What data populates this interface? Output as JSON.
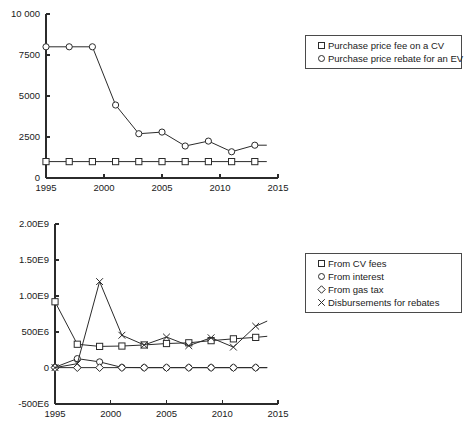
{
  "chart_data": [
    {
      "id": "top",
      "type": "line",
      "title": "",
      "xlabel": "",
      "ylabel": "",
      "xlim": [
        1995,
        2015
      ],
      "ylim": [
        0,
        10000
      ],
      "grid": false,
      "legend_position": "right",
      "x_ticks": [
        "1995",
        "2000",
        "2005",
        "2010",
        "2015"
      ],
      "x_tick_values": [
        1995,
        2000,
        2005,
        2010,
        2015
      ],
      "y_ticks": [
        "0",
        "2500",
        "5000",
        "7500",
        "10 000"
      ],
      "y_tick_values": [
        0,
        2500,
        5000,
        7500,
        10000
      ],
      "x": [
        1995,
        1997,
        1999,
        2001,
        2003,
        2005,
        2007,
        2009,
        2011,
        2013
      ],
      "series": [
        {
          "name": "Purchase price fee on a CV",
          "marker": "square",
          "values": [
            1000,
            1000,
            1000,
            1000,
            1000,
            1000,
            1000,
            1000,
            1000,
            1000
          ],
          "tail_x": 2014,
          "tail_y": 1000
        },
        {
          "name": "Purchase price rebate for an EV",
          "marker": "circle",
          "values": [
            8000,
            8000,
            8000,
            4450,
            2700,
            2800,
            1950,
            2250,
            1600,
            2000
          ],
          "tail_x": 2014,
          "tail_y": 2000
        }
      ]
    },
    {
      "id": "bottom",
      "type": "line",
      "title": "",
      "xlabel": "",
      "ylabel": "",
      "xlim": [
        1995,
        2015
      ],
      "ylim": [
        -500000000,
        2000000000
      ],
      "grid": false,
      "legend_position": "right",
      "x_ticks": [
        "1995",
        "2000",
        "2005",
        "2010",
        "2015"
      ],
      "x_tick_values": [
        1995,
        2000,
        2005,
        2010,
        2015
      ],
      "y_ticks": [
        "-500E6",
        "0",
        "500E6",
        "1.00E9",
        "1.50E9",
        "2.00E9"
      ],
      "y_tick_values": [
        -500000000,
        0,
        500000000,
        1000000000,
        1500000000,
        2000000000
      ],
      "x": [
        1995,
        1997,
        1999,
        2001,
        2003,
        2005,
        2007,
        2009,
        2011,
        2013
      ],
      "series": [
        {
          "name": "From CV fees",
          "marker": "square",
          "values": [
            920000000,
            330000000,
            300000000,
            305000000,
            320000000,
            340000000,
            350000000,
            380000000,
            405000000,
            425000000
          ],
          "tail_x": 2014,
          "tail_y": 440000000
        },
        {
          "name": "From interest",
          "marker": "circle",
          "values": [
            10000000,
            130000000,
            85000000,
            8000000,
            5000000,
            5000000,
            5000000,
            5000000,
            5000000,
            5000000
          ],
          "tail_x": 2014,
          "tail_y": 5000000
        },
        {
          "name": "From gas tax",
          "marker": "diamond",
          "values": [
            5000000,
            5000000,
            5000000,
            5000000,
            5000000,
            5000000,
            5000000,
            5000000,
            5000000,
            5000000
          ],
          "tail_x": 2014,
          "tail_y": 5000000
        },
        {
          "name": "Disbursements for rebates",
          "marker": "x",
          "values": [
            5000000,
            60000000,
            1200000000,
            455000000,
            320000000,
            430000000,
            310000000,
            420000000,
            290000000,
            580000000
          ],
          "tail_x": 2014,
          "tail_y": 650000000
        }
      ]
    }
  ],
  "legends": {
    "top": {
      "items": [
        {
          "label": "Purchase price fee on a CV",
          "marker": "square"
        },
        {
          "label": "Purchase price rebate for an EV",
          "marker": "circle"
        }
      ]
    },
    "bottom": {
      "items": [
        {
          "label": "From CV fees",
          "marker": "square"
        },
        {
          "label": "From interest",
          "marker": "circle"
        },
        {
          "label": "From gas tax",
          "marker": "diamond"
        },
        {
          "label": "Disbursements for rebates",
          "marker": "x"
        }
      ]
    }
  },
  "colors": {
    "ink": "#2b2b2b",
    "background": "#ffffff"
  }
}
